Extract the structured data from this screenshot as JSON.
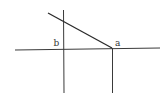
{
  "diagram": {
    "labels": {
      "b": "b",
      "a": "a"
    },
    "colors": {
      "line": "#3a3a3a",
      "background": "#ffffff"
    },
    "elements": [
      {
        "name": "horizontal-axis",
        "type": "line"
      },
      {
        "name": "vertical-line-b",
        "type": "line"
      },
      {
        "name": "vertical-line-a",
        "type": "line"
      },
      {
        "name": "diagonal-line",
        "type": "line",
        "from": "upper-left",
        "to": "a"
      }
    ]
  }
}
